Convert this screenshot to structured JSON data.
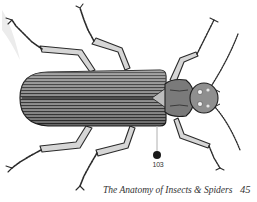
{
  "figure": {
    "callout_number": "103",
    "callout_color": "#1a1a1a",
    "leader_line_color": "#b0b0b0"
  },
  "footer": {
    "running_title": "The Anatomy of Insects & Spiders",
    "page_number": "45"
  },
  "colors": {
    "ink": "#2a2a2a",
    "leg_fill": "#cfcfcf",
    "paper": "#ffffff"
  }
}
